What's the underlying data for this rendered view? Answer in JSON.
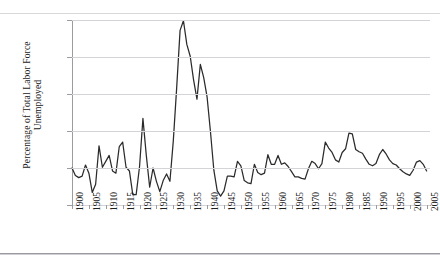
{
  "chart_data": {
    "type": "line",
    "title": "",
    "xlabel": "",
    "ylabel_lines": [
      "Percentage of Total Labor Force",
      "Unemployed"
    ],
    "ylabel": "Percentage of Total Labor Force Unemployed",
    "ylim": [
      0,
      25
    ],
    "ytick_labels": [
      "25",
      "20",
      "15",
      "10",
      "5",
      "0"
    ],
    "ytick_values": [
      25,
      20,
      15,
      10,
      5,
      0
    ],
    "xlim": [
      1900,
      2006
    ],
    "xtick_labels": [
      "1900",
      "1905",
      "1910",
      "1915",
      "1920",
      "1925",
      "1930",
      "1935",
      "1940",
      "1945",
      "1950",
      "1955",
      "1960",
      "1965",
      "1970",
      "1975",
      "1980",
      "1985",
      "1990",
      "1995",
      "2000",
      "2005"
    ],
    "xtick_values": [
      1900,
      1905,
      1910,
      1915,
      1920,
      1925,
      1930,
      1935,
      1940,
      1945,
      1950,
      1955,
      1960,
      1965,
      1970,
      1975,
      1980,
      1985,
      1990,
      1995,
      2000,
      2005
    ],
    "grid": "horizontal",
    "legend": "none",
    "series_color": "#2b2b2b",
    "series": [
      {
        "name": "Unemployment rate",
        "x": [
          1900,
          1901,
          1902,
          1903,
          1904,
          1905,
          1906,
          1907,
          1908,
          1909,
          1910,
          1911,
          1912,
          1913,
          1914,
          1915,
          1916,
          1917,
          1918,
          1919,
          1920,
          1921,
          1922,
          1923,
          1924,
          1925,
          1926,
          1927,
          1928,
          1929,
          1930,
          1931,
          1932,
          1933,
          1934,
          1935,
          1936,
          1937,
          1938,
          1939,
          1940,
          1941,
          1942,
          1943,
          1944,
          1945,
          1946,
          1947,
          1948,
          1949,
          1950,
          1951,
          1952,
          1953,
          1954,
          1955,
          1956,
          1957,
          1958,
          1959,
          1960,
          1961,
          1962,
          1963,
          1964,
          1965,
          1966,
          1967,
          1968,
          1969,
          1970,
          1971,
          1972,
          1973,
          1974,
          1975,
          1976,
          1977,
          1978,
          1979,
          1980,
          1981,
          1982,
          1983,
          1984,
          1985,
          1986,
          1987,
          1988,
          1989,
          1990,
          1991,
          1992,
          1993,
          1994,
          1995,
          1996,
          1997,
          1998,
          1999,
          2000,
          2001,
          2002,
          2003,
          2004,
          2005
        ],
        "values": [
          5.0,
          4.0,
          3.7,
          3.9,
          5.4,
          4.3,
          1.7,
          2.8,
          8.0,
          5.1,
          5.9,
          6.7,
          4.6,
          4.3,
          7.9,
          8.5,
          5.1,
          4.6,
          1.4,
          1.4,
          5.2,
          11.7,
          6.7,
          2.4,
          5.0,
          3.2,
          1.8,
          3.3,
          4.2,
          3.2,
          8.7,
          15.9,
          23.6,
          24.9,
          21.7,
          20.1,
          16.9,
          14.3,
          19.0,
          17.2,
          14.6,
          9.9,
          4.7,
          1.9,
          1.2,
          1.9,
          3.9,
          3.9,
          3.8,
          5.9,
          5.3,
          3.3,
          3.0,
          2.9,
          5.5,
          4.4,
          4.1,
          4.3,
          6.8,
          5.5,
          5.5,
          6.7,
          5.5,
          5.7,
          5.2,
          4.5,
          3.8,
          3.8,
          3.6,
          3.5,
          4.9,
          5.9,
          5.6,
          4.9,
          5.6,
          8.5,
          7.7,
          7.1,
          6.1,
          5.8,
          7.1,
          7.6,
          9.7,
          9.6,
          7.5,
          7.2,
          7.0,
          6.2,
          5.5,
          5.3,
          5.6,
          6.8,
          7.5,
          6.9,
          6.1,
          5.6,
          5.4,
          4.9,
          4.5,
          4.2,
          4.0,
          4.7,
          5.8,
          6.0,
          5.5,
          4.6
        ]
      }
    ]
  }
}
